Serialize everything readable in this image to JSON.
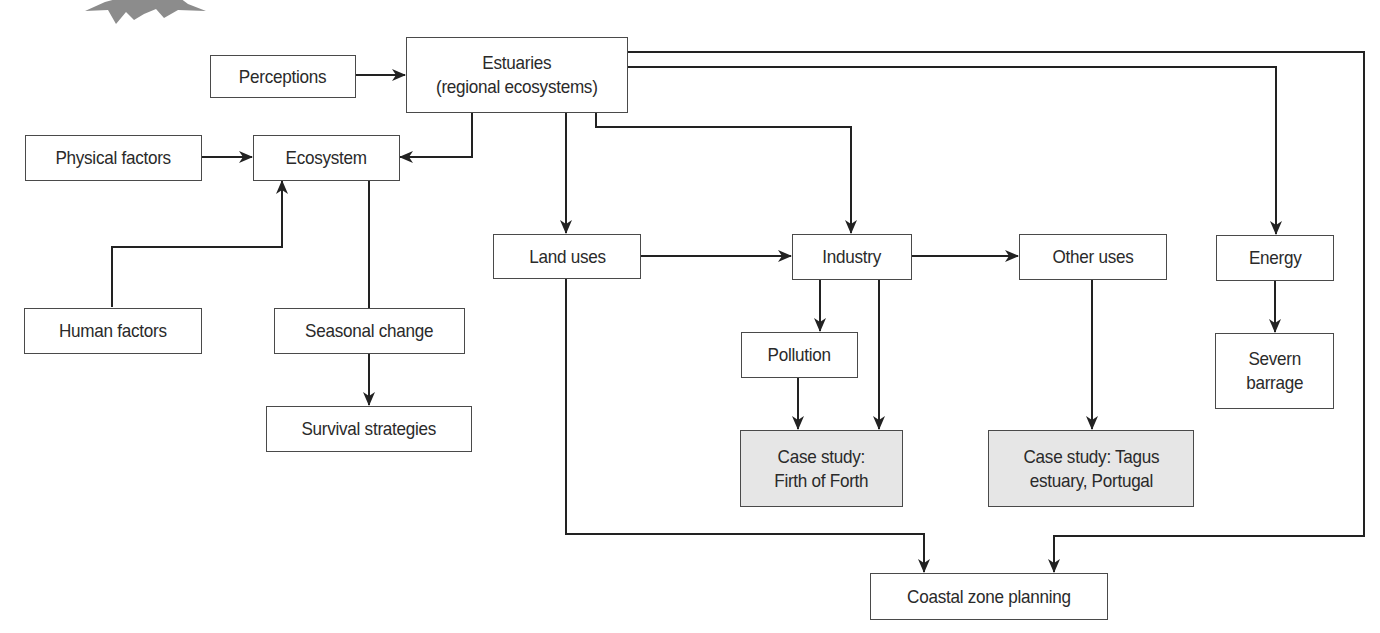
{
  "diagram": {
    "type": "flowchart",
    "topic": "Estuaries",
    "colors": {
      "box_border": "#4a4a4a",
      "box_fill": "#ffffff",
      "case_study_fill": "#e6e6e6",
      "line": "#222222",
      "decoration": "#8c8c8c"
    },
    "nodes": {
      "perceptions": {
        "label": "Perceptions"
      },
      "estuaries": {
        "label": "Estuaries\n(regional ecosystems)"
      },
      "physical_factors": {
        "label": "Physical factors"
      },
      "ecosystem": {
        "label": "Ecosystem"
      },
      "human_factors": {
        "label": "Human factors"
      },
      "seasonal_change": {
        "label": "Seasonal change"
      },
      "survival_strategies": {
        "label": "Survival strategies"
      },
      "land_uses": {
        "label": "Land uses"
      },
      "industry": {
        "label": "Industry"
      },
      "other_uses": {
        "label": "Other uses"
      },
      "energy": {
        "label": "Energy"
      },
      "severn_barrage": {
        "label": "Severn\nbarrage"
      },
      "pollution": {
        "label": "Pollution"
      },
      "case_firth": {
        "label": "Case study:\nFirth of Forth",
        "shaded": true
      },
      "case_tagus": {
        "label": "Case study: Tagus\nestuary, Portugal",
        "shaded": true
      },
      "coastal_planning": {
        "label": "Coastal zone planning"
      }
    },
    "edges": [
      {
        "from": "perceptions",
        "to": "estuaries"
      },
      {
        "from": "estuaries",
        "to": "ecosystem"
      },
      {
        "from": "physical_factors",
        "to": "ecosystem"
      },
      {
        "from": "human_factors",
        "to": "ecosystem"
      },
      {
        "from": "ecosystem",
        "to": "seasonal_change",
        "arrow": false
      },
      {
        "from": "seasonal_change",
        "to": "survival_strategies"
      },
      {
        "from": "estuaries",
        "to": "land_uses"
      },
      {
        "from": "estuaries",
        "to": "industry"
      },
      {
        "from": "estuaries",
        "to": "energy"
      },
      {
        "from": "estuaries",
        "to": "coastal_planning"
      },
      {
        "from": "land_uses",
        "to": "industry"
      },
      {
        "from": "industry",
        "to": "other_uses"
      },
      {
        "from": "industry",
        "to": "pollution"
      },
      {
        "from": "industry",
        "to": "case_firth"
      },
      {
        "from": "pollution",
        "to": "case_firth"
      },
      {
        "from": "other_uses",
        "to": "case_tagus"
      },
      {
        "from": "energy",
        "to": "severn_barrage"
      },
      {
        "from": "land_uses",
        "to": "coastal_planning"
      }
    ]
  }
}
